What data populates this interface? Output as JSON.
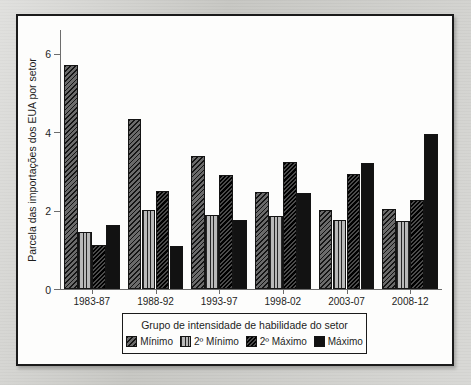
{
  "chart_data": {
    "type": "bar",
    "title": "",
    "xlabel": "",
    "ylabel": "Parcela das importações dos EUA por setor",
    "ylim": [
      0,
      6.6
    ],
    "yticks": [
      0,
      2,
      4,
      6
    ],
    "ytick_labels": [
      "0",
      "2",
      "4",
      "6"
    ],
    "grid": false,
    "legend_position": "bottom-center",
    "legend_title": "Grupo de intensidade de habilidade do setor",
    "categories": [
      "1983-87",
      "1988-92",
      "1993-97",
      "1998-02",
      "2003-07",
      "2008-12"
    ],
    "series": [
      {
        "name": "Mínimo",
        "pattern": "diagonal-hatch",
        "color": "#6b6b6b",
        "values": [
          5.72,
          4.32,
          3.4,
          2.46,
          2.02,
          2.04
        ]
      },
      {
        "name": "2º Mínimo",
        "pattern": "vertical-lines",
        "color": "#b9b9b9",
        "values": [
          1.46,
          2.02,
          1.88,
          1.86,
          1.76,
          1.74
        ]
      },
      {
        "name": "2º Máximo",
        "pattern": "dense-dark-hatch",
        "color": "#232323",
        "values": [
          1.12,
          2.5,
          2.9,
          3.24,
          2.94,
          2.28
        ]
      },
      {
        "name": "Máximo",
        "pattern": "solid",
        "color": "#121212",
        "values": [
          1.64,
          1.1,
          1.76,
          2.44,
          3.22,
          3.94
        ]
      }
    ]
  },
  "figure": {
    "panel_border_color": "#1b1b1b",
    "panel_background": "#fdfdfc",
    "page_background": "#c8c8c4",
    "axis_color": "#6d6d6d",
    "text_color": "#1d1d1d"
  }
}
